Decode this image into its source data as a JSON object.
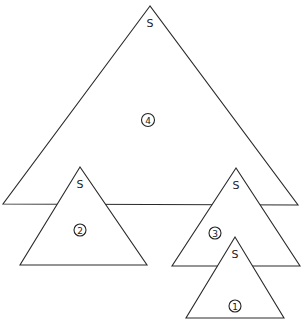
{
  "diagram": {
    "stroke_color": "#2a2a2a",
    "fill_color": "#ffffff",
    "triangles": [
      {
        "id": 4,
        "apex_label": "S",
        "number_label": "4",
        "points": "150,6 3,204 298,205",
        "apex_label_pos": [
          150,
          27
        ],
        "number_pos": [
          148,
          120
        ],
        "number_radius": 6.5
      },
      {
        "id": 2,
        "apex_label": "S",
        "number_label": "2",
        "points": "80,167 20,265 147,265",
        "apex_label_pos": [
          80,
          188
        ],
        "number_pos": [
          80,
          230
        ],
        "number_radius": 6
      },
      {
        "id": 3,
        "apex_label": "S",
        "number_label": "3",
        "points": "236,168 172,266 300,266",
        "apex_label_pos": [
          236,
          189
        ],
        "number_pos": [
          215,
          233
        ],
        "number_radius": 6
      },
      {
        "id": 1,
        "apex_label": "S",
        "number_label": "1",
        "points": "235,237 186,318 284,318",
        "apex_label_pos": [
          235,
          258
        ],
        "number_pos": [
          235,
          306
        ],
        "number_radius": 6
      }
    ]
  }
}
